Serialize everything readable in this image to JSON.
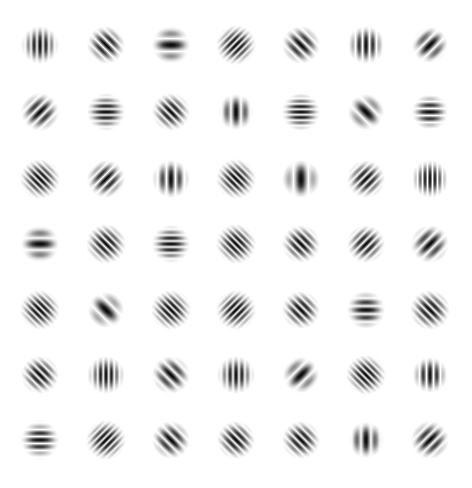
{
  "title": "Gabor filter bank",
  "grid": {
    "rows": 7,
    "cols": 7,
    "col_centers": [
      40,
      106,
      171,
      236,
      301,
      366,
      430
    ],
    "row_centers": [
      45,
      112,
      179,
      244,
      310,
      375,
      440
    ]
  },
  "colors": {
    "background": "#ffffff",
    "ink": "#000000"
  },
  "patches": [
    [
      {
        "orientation": 0,
        "period": 6,
        "sigma": 9
      },
      {
        "orientation": 45,
        "period": 7,
        "sigma": 9
      },
      {
        "orientation": 90,
        "period": 13,
        "sigma": 9
      },
      {
        "orientation": -45,
        "period": 5,
        "sigma": 9.5
      },
      {
        "orientation": 45,
        "period": 8,
        "sigma": 9
      },
      {
        "orientation": 0,
        "period": 7,
        "sigma": 9
      },
      {
        "orientation": -45,
        "period": 10,
        "sigma": 8.5
      }
    ],
    [
      {
        "orientation": -45,
        "period": 8,
        "sigma": 9
      },
      {
        "orientation": 90,
        "period": 6,
        "sigma": 9
      },
      {
        "orientation": 45,
        "period": 6,
        "sigma": 9
      },
      {
        "orientation": 0,
        "period": 10,
        "sigma": 8.5
      },
      {
        "orientation": 90,
        "period": 5.5,
        "sigma": 9
      },
      {
        "orientation": 45,
        "period": 13,
        "sigma": 8.5
      },
      {
        "orientation": 90,
        "period": 7,
        "sigma": 8.5
      }
    ],
    [
      {
        "orientation": 45,
        "period": 5,
        "sigma": 9.5
      },
      {
        "orientation": -45,
        "period": 7,
        "sigma": 9
      },
      {
        "orientation": 0,
        "period": 9,
        "sigma": 9
      },
      {
        "orientation": 45,
        "period": 5,
        "sigma": 9.5
      },
      {
        "orientation": 0,
        "period": 15,
        "sigma": 9
      },
      {
        "orientation": -45,
        "period": 6,
        "sigma": 9
      },
      {
        "orientation": 0,
        "period": 5,
        "sigma": 9
      }
    ],
    [
      {
        "orientation": 90,
        "period": 12,
        "sigma": 9
      },
      {
        "orientation": 45,
        "period": 5.5,
        "sigma": 9.5
      },
      {
        "orientation": 90,
        "period": 6,
        "sigma": 9
      },
      {
        "orientation": 45,
        "period": 5,
        "sigma": 9.5
      },
      {
        "orientation": 45,
        "period": 6,
        "sigma": 9
      },
      {
        "orientation": -45,
        "period": 6,
        "sigma": 9
      },
      {
        "orientation": -45,
        "period": 9,
        "sigma": 9
      }
    ],
    [
      {
        "orientation": 45,
        "period": 5,
        "sigma": 9.5
      },
      {
        "orientation": 45,
        "period": 14,
        "sigma": 8.5
      },
      {
        "orientation": 45,
        "period": 5,
        "sigma": 9.5
      },
      {
        "orientation": -45,
        "period": 5,
        "sigma": 9.5
      },
      {
        "orientation": 45,
        "period": 6,
        "sigma": 9
      },
      {
        "orientation": 90,
        "period": 8,
        "sigma": 9
      },
      {
        "orientation": 45,
        "period": 6,
        "sigma": 9.5
      }
    ],
    [
      {
        "orientation": 45,
        "period": 6,
        "sigma": 9
      },
      {
        "orientation": 0,
        "period": 5.5,
        "sigma": 9
      },
      {
        "orientation": 45,
        "period": 9,
        "sigma": 9
      },
      {
        "orientation": 0,
        "period": 6,
        "sigma": 9
      },
      {
        "orientation": -45,
        "period": 12,
        "sigma": 8.5
      },
      {
        "orientation": 45,
        "period": 5,
        "sigma": 9.5
      },
      {
        "orientation": 0,
        "period": 7,
        "sigma": 8.5
      }
    ],
    [
      {
        "orientation": 90,
        "period": 7,
        "sigma": 9
      },
      {
        "orientation": -45,
        "period": 5,
        "sigma": 9.5
      },
      {
        "orientation": 45,
        "period": 8,
        "sigma": 9
      },
      {
        "orientation": 45,
        "period": 6,
        "sigma": 9
      },
      {
        "orientation": 45,
        "period": 6,
        "sigma": 9
      },
      {
        "orientation": 0,
        "period": 10,
        "sigma": 8.5
      },
      {
        "orientation": -45,
        "period": 8,
        "sigma": 9
      }
    ]
  ]
}
